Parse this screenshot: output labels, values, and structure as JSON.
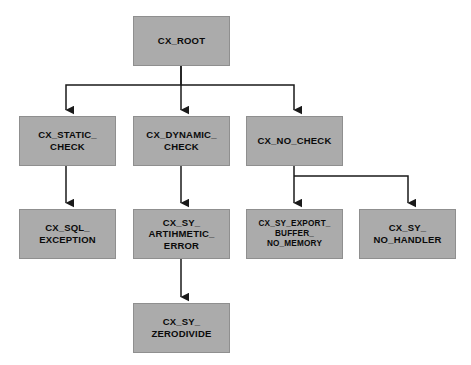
{
  "diagram": {
    "type": "hierarchy-tree",
    "style": {
      "node_fill": "#ababab",
      "node_border": "#8f8f8f",
      "edge_color": "#1a1a1a",
      "text_color": "#0a0a0a",
      "background": "#ffffff"
    },
    "nodes": [
      {
        "id": "cx_root",
        "label": "CX_ROOT",
        "x": 133,
        "y": 16,
        "w": 97,
        "h": 50,
        "font_size": 9.5
      },
      {
        "id": "cx_static_check",
        "label": "CX_STATIC_\nCHECK",
        "x": 19,
        "y": 116,
        "w": 97,
        "h": 50,
        "font_size": 9.5
      },
      {
        "id": "cx_dynamic_check",
        "label": "CX_DYNAMIC_\nCHECK",
        "x": 133,
        "y": 116,
        "w": 97,
        "h": 50,
        "font_size": 9.5
      },
      {
        "id": "cx_no_check",
        "label": "CX_NO_CHECK",
        "x": 246,
        "y": 116,
        "w": 97,
        "h": 50,
        "font_size": 9.5
      },
      {
        "id": "cx_sql_exception",
        "label": "CX_SQL_\nEXCEPTION",
        "x": 19,
        "y": 209,
        "w": 97,
        "h": 50,
        "font_size": 9.5
      },
      {
        "id": "cx_sy_arithmetic_error",
        "label": "CX_SY_\nARTIHMETIC_\nERROR",
        "x": 133,
        "y": 209,
        "w": 97,
        "h": 50,
        "font_size": 9.5
      },
      {
        "id": "cx_sy_export_buffer_no_memory",
        "label": "CX_SY_EXPORT_\nBUFFER_\nNO_MEMORY",
        "x": 246,
        "y": 209,
        "w": 97,
        "h": 50,
        "font_size": 8.2
      },
      {
        "id": "cx_sy_no_handler",
        "label": "CX_SY_\nNO_HANDLER",
        "x": 359,
        "y": 209,
        "w": 97,
        "h": 50,
        "font_size": 9.5
      },
      {
        "id": "cx_sy_zerodivide",
        "label": "CX_SY_\nZERODIVIDE",
        "x": 133,
        "y": 303,
        "w": 97,
        "h": 50,
        "font_size": 9.5
      }
    ],
    "edges": [
      {
        "id": "edge-root-static",
        "from": "cx_root",
        "to": "cx_static_check",
        "kind": "orthogonal-bus",
        "points": "181,66 181,85 66,85 66,110"
      },
      {
        "id": "edge-root-dynamic",
        "from": "cx_root",
        "to": "cx_dynamic_check",
        "kind": "straight",
        "points": "181,66 181,110"
      },
      {
        "id": "edge-root-nocheck",
        "from": "cx_root",
        "to": "cx_no_check",
        "kind": "orthogonal-bus",
        "points": "181,85 294,85 294,110"
      },
      {
        "id": "edge-static-sql",
        "from": "cx_static_check",
        "to": "cx_sql_exception",
        "kind": "straight",
        "points": "66,166 66,203"
      },
      {
        "id": "edge-dynamic-arithmetic",
        "from": "cx_dynamic_check",
        "to": "cx_sy_arithmetic_error",
        "kind": "straight",
        "points": "181,166 181,203"
      },
      {
        "id": "edge-nocheck-exportbuffer",
        "from": "cx_no_check",
        "to": "cx_sy_export_buffer_no_memory",
        "kind": "straight",
        "points": "294,166 294,203"
      },
      {
        "id": "edge-nocheck-nohandler",
        "from": "cx_no_check",
        "to": "cx_sy_no_handler",
        "kind": "orthogonal-bus",
        "points": "294,176 408,176 408,203"
      },
      {
        "id": "edge-arithmetic-zerodivide",
        "from": "cx_sy_arithmetic_error",
        "to": "cx_sy_zerodivide",
        "kind": "straight",
        "points": "181,259 181,297"
      }
    ]
  }
}
